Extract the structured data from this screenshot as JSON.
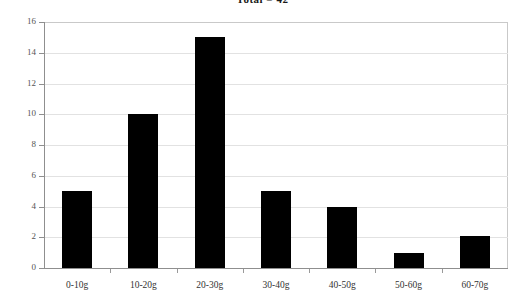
{
  "chart_data": {
    "type": "bar",
    "title": "Total = 42",
    "xlabel": "",
    "ylabel": "",
    "categories": [
      "0-10g",
      "10-20g",
      "20-30g",
      "30-40g",
      "40-50g",
      "50-60g",
      "60-70g"
    ],
    "values": [
      5,
      10,
      15,
      5,
      4,
      1,
      2.1
    ],
    "ylim": [
      0,
      16
    ],
    "ytick_labels": [
      "0",
      "2",
      "4",
      "6",
      "8",
      "10",
      "12",
      "14",
      "16"
    ],
    "ytick_values": [
      0,
      2,
      4,
      6,
      8,
      10,
      12,
      14,
      16
    ],
    "grid": true,
    "legend": "none",
    "bar_color": "#000000",
    "grid_color": "#e2e2e2",
    "axis_color": "#8f8f8f",
    "frame_color": "#c9c9c9"
  }
}
